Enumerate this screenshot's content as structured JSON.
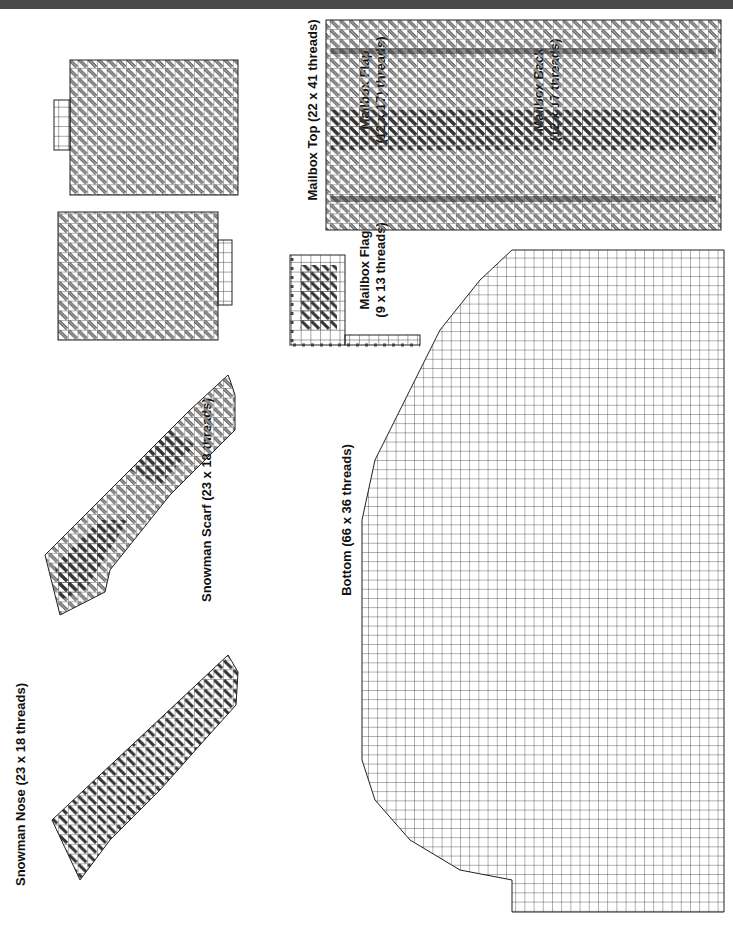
{
  "header": {
    "color": "#4a4a4a"
  },
  "pieces": [
    {
      "name": "Snowman Nose",
      "size": "(23 x 18 threads)",
      "label": "Snowman Nose (23 x 18 threads)"
    },
    {
      "name": "Snowman Scarf",
      "size": "(23 x 18 threads)",
      "label": "Snowman Scarf (23 x 18 threads)"
    },
    {
      "name": "Mailbox Flap",
      "size": "(12 x 17) threads)",
      "label_line1": "Mailbox Flap",
      "label_line2": "(12 x 17) threads)"
    },
    {
      "name": "Mailbox Back",
      "size": "(12 x 17 threads)",
      "label_line1": "Mailbox Back",
      "label_line2": "(12 x 17 threads)"
    },
    {
      "name": "Mailbox Top",
      "size": "(22 x 41 threads)",
      "label": "Mailbox Top (22 x 41 threads)"
    },
    {
      "name": "Mailbox Flag",
      "size": "(9 x 13 threads)",
      "label_line1": "Mailbox Flag",
      "label_line2": "(9 x 13 threads)"
    },
    {
      "name": "Bottom",
      "size": "(66 x 36 threads)",
      "label": "Bottom (66 x 36 threads)"
    }
  ],
  "colors": {
    "grid": "#222222",
    "dark_stitch": "#333333",
    "light_stitch": "#9a9a9a",
    "background": "#ffffff"
  }
}
